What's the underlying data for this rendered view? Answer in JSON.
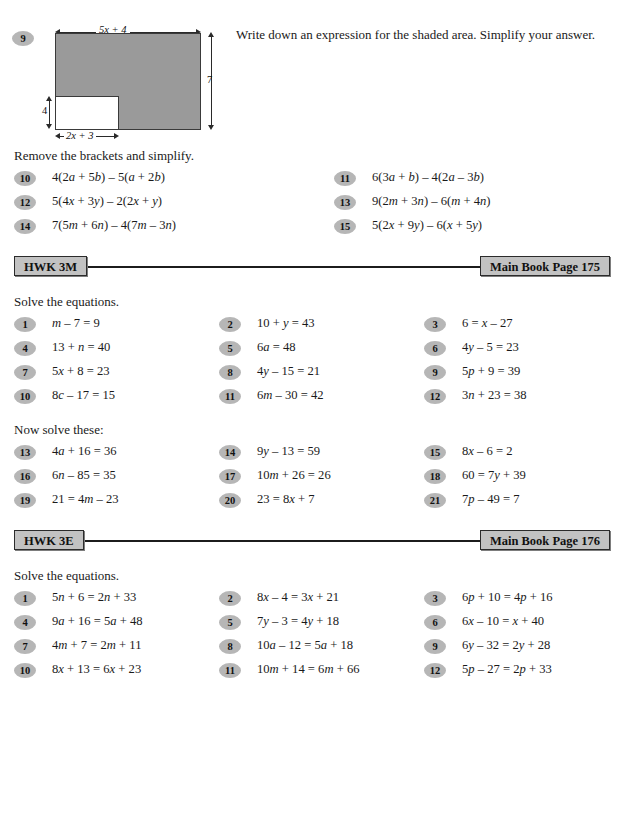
{
  "top_question": {
    "number": "9",
    "prompt": "Write down an expression for the shaded area. Simplify your answer.",
    "diagram": {
      "name": "shaded-rectangle-with-notch",
      "top_label": "5x + 4",
      "right_label": "7",
      "left_label": "4",
      "bottom_label": "2x + 3",
      "shade_color": "#9a9a9a"
    }
  },
  "brackets_section": {
    "instruction": "Remove the brackets and simplify.",
    "items": [
      {
        "number": "10",
        "expr": "4(2a + 5b) – 5(a + 2b)"
      },
      {
        "number": "11",
        "expr": "6(3a + b) – 4(2a – 3b)"
      },
      {
        "number": "12",
        "expr": "5(4x + 3y) – 2(2x + y)"
      },
      {
        "number": "13",
        "expr": "9(2m + 3n) – 6(m + 4n)"
      },
      {
        "number": "14",
        "expr": "7(5m + 6n) – 4(7m – 3n)"
      },
      {
        "number": "15",
        "expr": "5(2x + 9y) – 6(x + 5y)"
      }
    ]
  },
  "hwk_3m": {
    "tag": "HWK 3M",
    "page_ref": "Main Book Page 175",
    "instruction": "Solve the equations.",
    "items": [
      {
        "number": "1",
        "expr": "m – 7 = 9"
      },
      {
        "number": "2",
        "expr": "10 + y = 43"
      },
      {
        "number": "3",
        "expr": "6 = x – 27"
      },
      {
        "number": "4",
        "expr": "13 + n = 40"
      },
      {
        "number": "5",
        "expr": "6a = 48"
      },
      {
        "number": "6",
        "expr": "4y – 5 = 23"
      },
      {
        "number": "7",
        "expr": "5x + 8 = 23"
      },
      {
        "number": "8",
        "expr": "4y – 15 = 21"
      },
      {
        "number": "9",
        "expr": "5p + 9 = 39"
      },
      {
        "number": "10",
        "expr": "8c – 17 = 15"
      },
      {
        "number": "11",
        "expr": "6m – 30 = 42"
      },
      {
        "number": "12",
        "expr": "3n + 23 = 38"
      }
    ],
    "second_instruction": "Now solve these:",
    "second_items": [
      {
        "number": "13",
        "expr": "4a + 16 = 36"
      },
      {
        "number": "14",
        "expr": "9y – 13 = 59"
      },
      {
        "number": "15",
        "expr": "8x – 6 = 2"
      },
      {
        "number": "16",
        "expr": "6n – 85 = 35"
      },
      {
        "number": "17",
        "expr": "10m + 26 = 26"
      },
      {
        "number": "18",
        "expr": "60 = 7y + 39"
      },
      {
        "number": "19",
        "expr": "21 = 4m – 23"
      },
      {
        "number": "20",
        "expr": "23 = 8x + 7"
      },
      {
        "number": "21",
        "expr": "7p – 49 = 7"
      }
    ]
  },
  "hwk_3e": {
    "tag": "HWK 3E",
    "page_ref": "Main Book Page 176",
    "instruction": "Solve the equations.",
    "items": [
      {
        "number": "1",
        "expr": "5n + 6 = 2n + 33"
      },
      {
        "number": "2",
        "expr": "8x – 4 = 3x + 21"
      },
      {
        "number": "3",
        "expr": "6p + 10 = 4p + 16"
      },
      {
        "number": "4",
        "expr": "9a + 16 = 5a + 48"
      },
      {
        "number": "5",
        "expr": "7y – 3 = 4y + 18"
      },
      {
        "number": "6",
        "expr": "6x – 10 = x + 40"
      },
      {
        "number": "7",
        "expr": "4m + 7 = 2m + 11"
      },
      {
        "number": "8",
        "expr": "10a – 12 = 5a + 18"
      },
      {
        "number": "9",
        "expr": "6y – 32 = 2y + 28"
      },
      {
        "number": "10",
        "expr": "8x + 13 = 6x + 23"
      },
      {
        "number": "11",
        "expr": "10m + 14 = 6m + 66"
      },
      {
        "number": "12",
        "expr": "5p – 27 = 2p + 33"
      }
    ]
  }
}
